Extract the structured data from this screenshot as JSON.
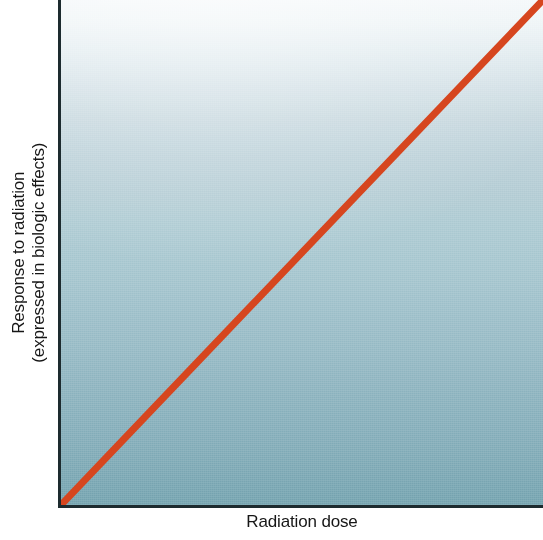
{
  "figure": {
    "name": "linear-nonthreshold-dose-response-graph",
    "background_color": "#ffffff"
  },
  "axes": {
    "x_label": "Radiation dose",
    "y_label_line1": "Response to radiation",
    "y_label_line2": "(expressed in biologic effects)",
    "axis_color": "#1d2b2f"
  },
  "panel": {
    "gradient_top_color": "#f4f8fa",
    "gradient_bottom_color": "#75a3af"
  },
  "chart_data": {
    "type": "line",
    "title": "",
    "subtitle": "",
    "xlabel": "Radiation dose",
    "ylabel": "Response to radiation (expressed in biologic effects)",
    "xlim": [
      0,
      100
    ],
    "ylim": [
      0,
      100
    ],
    "grid": false,
    "legend": null,
    "x_tick_labels": [],
    "y_tick_labels": [],
    "annotations": [],
    "series": [
      {
        "name": "Linear non-threshold dose-response",
        "color": "#d6461f",
        "line_width_px": 7,
        "x": [
          0,
          10,
          20,
          30,
          40,
          50,
          60,
          70,
          80,
          90,
          100
        ],
        "values": [
          0,
          10,
          20,
          30,
          40,
          50,
          60,
          70,
          80,
          90,
          100
        ]
      }
    ]
  }
}
